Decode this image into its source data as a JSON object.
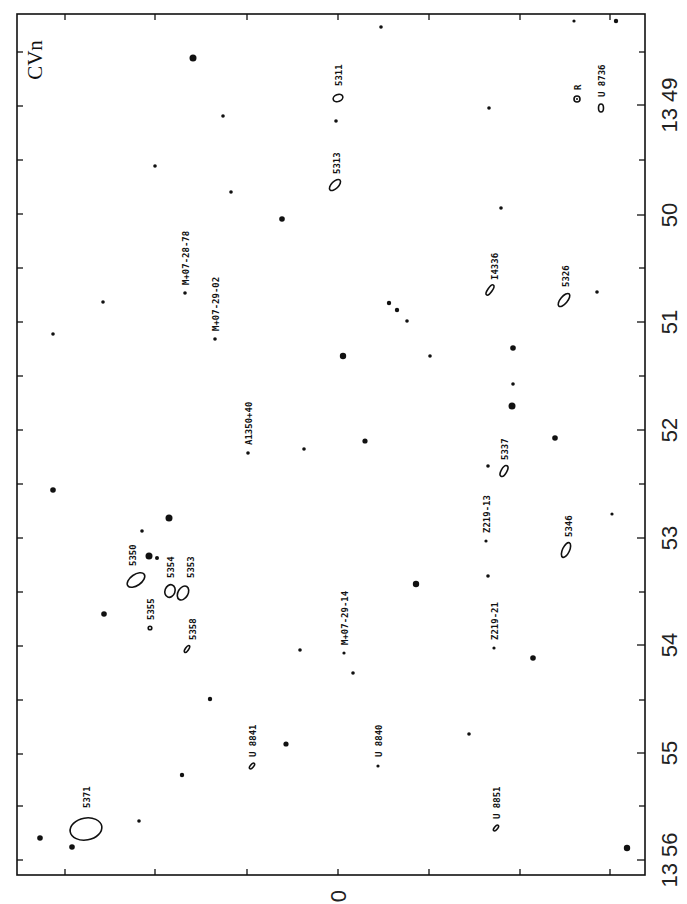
{
  "chart_data": {
    "type": "scatter",
    "title": "CVn",
    "frame": {
      "left": 17,
      "top": 14,
      "right": 645,
      "bottom": 875
    },
    "right_axis": {
      "label_rotation": -90,
      "ticks": [
        {
          "y": 105,
          "label": "13 49"
        },
        {
          "y": 215,
          "label": "50"
        },
        {
          "y": 322,
          "label": "51"
        },
        {
          "y": 430,
          "label": "52"
        },
        {
          "y": 538,
          "label": "53"
        },
        {
          "y": 645,
          "label": "54"
        },
        {
          "y": 753,
          "label": "55"
        },
        {
          "y": 860,
          "label": "13 56"
        }
      ],
      "minor_ticks": [
        52,
        160,
        268,
        376,
        484,
        592,
        700,
        806
      ]
    },
    "left_axis": {
      "minor_ticks": [
        52,
        160,
        268,
        376,
        484,
        592,
        700,
        806
      ]
    },
    "bottom_axis": {
      "ticks": [
        65,
        155,
        247,
        338,
        429,
        520,
        610
      ],
      "zero_label": {
        "x": 338,
        "text": "0"
      }
    },
    "top_axis": {
      "ticks": [
        65,
        155,
        247,
        338,
        429,
        520,
        610
      ]
    },
    "constellation_label": {
      "text": "CVn",
      "x": 34,
      "y": 60
    },
    "stars": [
      {
        "x": 193,
        "y": 58,
        "r": 3.5
      },
      {
        "x": 381,
        "y": 27,
        "r": 1.8
      },
      {
        "x": 574,
        "y": 21,
        "r": 1.6
      },
      {
        "x": 616,
        "y": 21,
        "r": 2.2
      },
      {
        "x": 223,
        "y": 116,
        "r": 1.8
      },
      {
        "x": 336,
        "y": 121,
        "r": 1.8
      },
      {
        "x": 489,
        "y": 108,
        "r": 1.8
      },
      {
        "x": 155,
        "y": 166,
        "r": 1.8
      },
      {
        "x": 231,
        "y": 192,
        "r": 1.8
      },
      {
        "x": 282,
        "y": 219,
        "r": 2.8
      },
      {
        "x": 501,
        "y": 208,
        "r": 1.8
      },
      {
        "x": 103,
        "y": 302,
        "r": 1.8
      },
      {
        "x": 389,
        "y": 303,
        "r": 2.2
      },
      {
        "x": 397,
        "y": 310,
        "r": 2.2
      },
      {
        "x": 407,
        "y": 321,
        "r": 1.8
      },
      {
        "x": 597,
        "y": 292,
        "r": 1.8
      },
      {
        "x": 53,
        "y": 334,
        "r": 1.8
      },
      {
        "x": 343,
        "y": 356,
        "r": 3.2
      },
      {
        "x": 430,
        "y": 356,
        "r": 1.8
      },
      {
        "x": 513,
        "y": 348,
        "r": 2.8
      },
      {
        "x": 513,
        "y": 384,
        "r": 1.8
      },
      {
        "x": 512,
        "y": 406,
        "r": 3.5
      },
      {
        "x": 304,
        "y": 449,
        "r": 1.8
      },
      {
        "x": 365,
        "y": 441,
        "r": 2.6
      },
      {
        "x": 555,
        "y": 438,
        "r": 2.8
      },
      {
        "x": 53,
        "y": 490,
        "r": 2.8
      },
      {
        "x": 488,
        "y": 466,
        "r": 1.8
      },
      {
        "x": 169,
        "y": 518,
        "r": 3.5
      },
      {
        "x": 142,
        "y": 531,
        "r": 1.8
      },
      {
        "x": 149,
        "y": 556,
        "r": 3.5
      },
      {
        "x": 157,
        "y": 558,
        "r": 2.0
      },
      {
        "x": 612,
        "y": 514,
        "r": 1.6
      },
      {
        "x": 416,
        "y": 584,
        "r": 3.2
      },
      {
        "x": 488,
        "y": 576,
        "r": 1.8
      },
      {
        "x": 104,
        "y": 614,
        "r": 2.8
      },
      {
        "x": 300,
        "y": 650,
        "r": 1.8
      },
      {
        "x": 353,
        "y": 673,
        "r": 1.8
      },
      {
        "x": 533,
        "y": 658,
        "r": 2.8
      },
      {
        "x": 210,
        "y": 699,
        "r": 2.2
      },
      {
        "x": 286,
        "y": 744,
        "r": 2.6
      },
      {
        "x": 469,
        "y": 734,
        "r": 1.8
      },
      {
        "x": 182,
        "y": 775,
        "r": 2.2
      },
      {
        "x": 139,
        "y": 821,
        "r": 1.8
      },
      {
        "x": 40,
        "y": 838,
        "r": 2.8
      },
      {
        "x": 72,
        "y": 847,
        "r": 2.8
      },
      {
        "x": 627,
        "y": 848,
        "r": 3.2
      }
    ],
    "galaxies": [
      {
        "name": "5311",
        "x": 338,
        "y": 98,
        "rx": 5,
        "ry": 3.5,
        "rot": -20,
        "label_x": 338,
        "label_y": 86,
        "label_dx": 4
      },
      {
        "name": "5313",
        "x": 335,
        "y": 185,
        "rx": 7,
        "ry": 3.5,
        "rot": -45,
        "label_x": 336,
        "label_y": 174,
        "label_dx": 4
      },
      {
        "name": "R",
        "x": 577,
        "y": 99,
        "rx": 3,
        "ry": 3,
        "rot": 0,
        "ring_dot": true,
        "label_x": 577,
        "label_y": 90,
        "label_dx": 4
      },
      {
        "name": "U 8736",
        "x": 601,
        "y": 108,
        "rx": 2.5,
        "ry": 4,
        "rot": 0,
        "label_x": 601,
        "label_y": 97,
        "label_dx": 4
      },
      {
        "name": "M+07-28-78",
        "x": 185,
        "y": 293,
        "rx": 1.8,
        "ry": 1.8,
        "rot": 0,
        "point": true,
        "label_x": 185,
        "label_y": 285,
        "label_dx": 4
      },
      {
        "name": "M+07-29-02",
        "x": 215,
        "y": 339,
        "rx": 1.8,
        "ry": 1.8,
        "rot": 0,
        "point": true,
        "label_x": 215,
        "label_y": 331,
        "label_dx": 4
      },
      {
        "name": "I4336",
        "x": 490,
        "y": 290,
        "rx": 2.2,
        "ry": 6,
        "rot": 35,
        "label_x": 494,
        "label_y": 280,
        "label_dx": 4
      },
      {
        "name": "5326",
        "x": 564,
        "y": 300,
        "rx": 3.5,
        "ry": 8,
        "rot": 40,
        "label_x": 565,
        "label_y": 287,
        "label_dx": 4
      },
      {
        "name": "A1350+40",
        "x": 248,
        "y": 453,
        "rx": 1.8,
        "ry": 1.8,
        "rot": 0,
        "point": true,
        "label_x": 248,
        "label_y": 445,
        "label_dx": 4
      },
      {
        "name": "5337",
        "x": 504,
        "y": 471,
        "rx": 2.8,
        "ry": 6,
        "rot": 30,
        "label_x": 504,
        "label_y": 460,
        "label_dx": 4
      },
      {
        "name": "Z219-13",
        "x": 486,
        "y": 541,
        "rx": 1.6,
        "ry": 1.6,
        "rot": 0,
        "point": true,
        "label_x": 486,
        "label_y": 533,
        "label_dx": 4
      },
      {
        "name": "5346",
        "x": 566,
        "y": 550,
        "rx": 3.5,
        "ry": 8,
        "rot": 25,
        "label_x": 568,
        "label_y": 537,
        "label_dx": 4
      },
      {
        "name": "5350",
        "x": 136,
        "y": 580,
        "rx": 5.5,
        "ry": 10,
        "rot": 55,
        "label_x": 132,
        "label_y": 566,
        "label_dx": 4
      },
      {
        "name": "5354",
        "x": 170,
        "y": 591,
        "rx": 5,
        "ry": 6.5,
        "rot": 20,
        "label_x": 170,
        "label_y": 578,
        "label_dx": 4
      },
      {
        "name": "5353",
        "x": 183,
        "y": 593,
        "rx": 5,
        "ry": 7.5,
        "rot": 30,
        "label_x": 190,
        "label_y": 578,
        "label_dx": 4
      },
      {
        "name": "5355",
        "x": 150,
        "y": 628,
        "rx": 1.8,
        "ry": 1.8,
        "rot": 0,
        "point_open": true,
        "label_x": 150,
        "label_y": 620,
        "label_dx": 4
      },
      {
        "name": "5358",
        "x": 187,
        "y": 649,
        "rx": 1.6,
        "ry": 4,
        "rot": 35,
        "label_x": 192,
        "label_y": 640,
        "label_dx": 4
      },
      {
        "name": "M+07-29-14",
        "x": 344,
        "y": 653,
        "rx": 1.6,
        "ry": 1.6,
        "rot": 0,
        "point": true,
        "label_x": 344,
        "label_y": 645,
        "label_dx": 4
      },
      {
        "name": "Z219-21",
        "x": 494,
        "y": 648,
        "rx": 1.6,
        "ry": 1.6,
        "rot": 0,
        "point": true,
        "label_x": 494,
        "label_y": 640,
        "label_dx": 4
      },
      {
        "name": "U 8841",
        "x": 252,
        "y": 766,
        "rx": 1.6,
        "ry": 3.5,
        "rot": 40,
        "label_x": 252,
        "label_y": 757,
        "label_dx": 4
      },
      {
        "name": "U 8840",
        "x": 378,
        "y": 766,
        "rx": 1.6,
        "ry": 1.8,
        "rot": 0,
        "point": true,
        "label_x": 378,
        "label_y": 757,
        "label_dx": 4
      },
      {
        "name": "U 8851",
        "x": 496,
        "y": 828,
        "rx": 1.6,
        "ry": 3.5,
        "rot": 40,
        "label_x": 496,
        "label_y": 819,
        "label_dx": 4
      },
      {
        "name": "5371",
        "x": 86,
        "y": 829,
        "rx": 16,
        "ry": 11,
        "rot": -10,
        "label_x": 86,
        "label_y": 808,
        "label_dx": 4
      }
    ]
  }
}
